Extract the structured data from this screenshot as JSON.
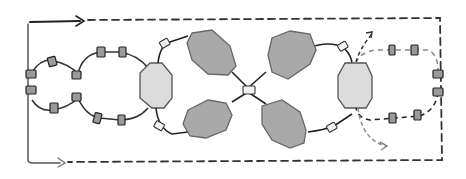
{
  "diagram": {
    "colors": {
      "background": "#ffffff",
      "line_dark": "#222222",
      "line_gray": "#666666",
      "dashed_gray": "#888888",
      "large_octagon_fill": "#a9a9a9",
      "light_octagon_fill": "#dcdcdc",
      "bead_fill": "#9a9a9a",
      "bead_light_fill": "#eeeeee"
    },
    "elements": {
      "large_dark_octagons": 4,
      "light_octagons": 2,
      "white_connector_beads": 5,
      "gray_beads_left_loops": 12,
      "gray_beads_right_loop": 6,
      "arrows": [
        "top-right dashed frame",
        "bottom dashed frame",
        "right branch up-arrow",
        "right branch down-arrow"
      ]
    }
  }
}
